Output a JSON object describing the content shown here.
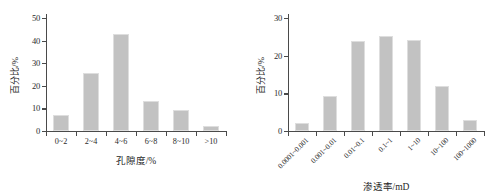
{
  "figure": {
    "bar_color": "#c2c2c2",
    "bar_edge_color": "#dedede",
    "axis_color": "#4a4a4a",
    "background": "#ffffff"
  },
  "chart_data": [
    {
      "id": "porosity-histogram",
      "type": "bar",
      "title": "",
      "xlabel": "孔隙度/%",
      "ylabel": "百分比/%",
      "categories": [
        "0~2",
        "2~4",
        "4~6",
        "6~8",
        "8~10",
        ">10"
      ],
      "values": [
        7.0,
        25.5,
        43.0,
        13.5,
        9.2,
        2.2
      ],
      "ylim": [
        0,
        50
      ],
      "yticks": [
        0,
        10,
        20,
        30,
        40,
        50
      ],
      "ytick_labels": [
        "0",
        "10",
        "20",
        "30",
        "40",
        "50"
      ],
      "grid": false,
      "legend": false,
      "tick_label_rotation": 0
    },
    {
      "id": "permeability-histogram",
      "type": "bar",
      "title": "",
      "xlabel": "渗透率/mD",
      "ylabel": "百分比/%",
      "categories": [
        "0.0001~0.001",
        "0.001~0.01",
        "0.01~0.1",
        "0.1~1",
        "1~10",
        "10~100",
        "100~1000"
      ],
      "values": [
        2.2,
        9.2,
        24.0,
        25.3,
        24.2,
        12.0,
        3.0
      ],
      "ylim": [
        0,
        30
      ],
      "yticks": [
        0,
        10,
        20,
        30
      ],
      "ytick_labels": [
        "0",
        "10",
        "20",
        "30"
      ],
      "grid": false,
      "legend": false,
      "tick_label_rotation": -45
    }
  ]
}
